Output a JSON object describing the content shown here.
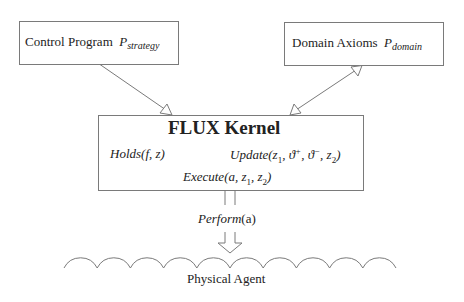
{
  "boxes": {
    "control": {
      "label": "Control Program",
      "symbol": "P",
      "subscript": "strategy"
    },
    "domain": {
      "label": "Domain Axioms",
      "symbol": "P",
      "subscript": "domain"
    },
    "kernel": {
      "title": "FLUX Kernel",
      "holds": {
        "name": "Holds",
        "args": "(f, z)"
      },
      "update": {
        "name": "Update",
        "args_pre": "(z",
        "a1": "1",
        "sep1": ", ϑ",
        "sup1": "+",
        "sep2": ", ϑ",
        "sup2": "−",
        "sep3": ", z",
        "a2": "2",
        "close": ")"
      },
      "execute": {
        "name": "Execute",
        "args_pre": "(a, z",
        "a1": "1",
        "sep": ", z",
        "a2": "2",
        "close": ")"
      }
    }
  },
  "arrows": {
    "control_to_kernel": "single-headed",
    "domain_kernel": "double-headed",
    "kernel_to_agent": {
      "label_name": "Perform",
      "label_args": "(a)"
    }
  },
  "agent": {
    "label": "Physical Agent",
    "arch_count": 10
  },
  "colors": {
    "stroke": "#7a7a7a",
    "text": "#222222"
  }
}
